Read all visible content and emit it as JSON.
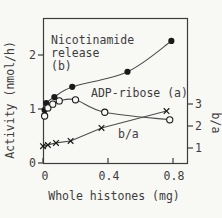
{
  "figure": {
    "background": "#f8f8f5",
    "ink_color": "#3d3d3d",
    "line_color": "#4d4d4d",
    "marker_color": "#1a1a1a"
  },
  "chart_data": {
    "type": "scatter",
    "title": "",
    "xlabel": "Whole histones (mg)",
    "ylabel_left": "Activity (nmol/h)",
    "ylabel_right": "b/a",
    "xlim": [
      0,
      0.89
    ],
    "xticks": [
      0,
      0.4,
      0.8
    ],
    "xtick_labels": [
      "0",
      "0.4",
      "0.8"
    ],
    "ylim_left": [
      0,
      2.69
    ],
    "yticks_left": [
      0,
      1,
      2
    ],
    "ytick_labels_left": [
      "0",
      "1",
      "2"
    ],
    "ylim_right": [
      1,
      3
    ],
    "yticks_right": [
      1,
      2,
      3
    ],
    "ytick_labels_right": [
      "1",
      "2",
      "3"
    ],
    "grid": false,
    "legend": "in-plot text annotations",
    "series": [
      {
        "name": "Nicotinamide release (b)",
        "marker": "filled-circle",
        "axis": "left",
        "line": "smooth",
        "points": [
          [
            0.01,
            0.98
          ],
          [
            0.02,
            1.11
          ],
          [
            0.07,
            1.22
          ],
          [
            0.18,
            1.41
          ],
          [
            0.52,
            1.69
          ],
          [
            0.79,
            2.26
          ]
        ]
      },
      {
        "name": "ADP-ribose (a)",
        "marker": "open-circle",
        "axis": "left",
        "line": "smooth",
        "points": [
          [
            0.01,
            0.87
          ],
          [
            0.03,
            1.02
          ],
          [
            0.06,
            1.09
          ],
          [
            0.1,
            1.15
          ],
          [
            0.2,
            1.17
          ],
          [
            0.38,
            0.94
          ],
          [
            0.78,
            0.8
          ]
        ]
      },
      {
        "name": "b/a",
        "marker": "x",
        "axis": "right",
        "line": "straight",
        "points": [
          [
            0.0,
            1.08
          ],
          [
            0.03,
            1.14
          ],
          [
            0.08,
            1.23
          ],
          [
            0.17,
            1.32
          ],
          [
            0.36,
            1.91
          ],
          [
            0.76,
            2.68
          ]
        ]
      }
    ],
    "annotations": [
      {
        "id": "label-series-b",
        "lines": [
          "Nicotinamide",
          "release",
          "(b)"
        ],
        "x": 51,
        "y": 44,
        "line_height": 13
      },
      {
        "id": "label-series-a",
        "lines": [
          "ADP-ribose (a)"
        ],
        "x": 91,
        "y": 97,
        "line_height": 13
      },
      {
        "id": "label-series-ba",
        "lines": [
          "b/a"
        ],
        "x": 118,
        "y": 138,
        "line_height": 13
      }
    ]
  }
}
